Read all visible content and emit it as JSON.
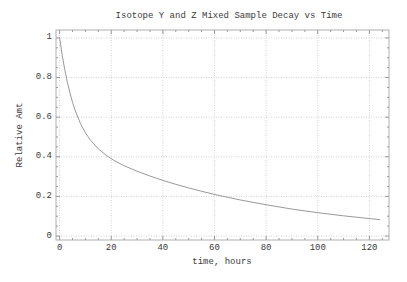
{
  "colors": {
    "background": "#ffffff",
    "curve": "#999999",
    "grid": "#d2d2d2",
    "frame": "#b0b0b0",
    "ticks": "#9a9a9a",
    "text": "#3b3b3b"
  },
  "chart_data": {
    "type": "line",
    "title": "Isotope Y and Z Mixed Sample Decay vs Time",
    "xlabel": "time, hours",
    "ylabel": "Relative Amt",
    "xlim": [
      -1.4,
      127.6
    ],
    "ylim": [
      -0.02,
      1.04
    ],
    "grid": true,
    "x_major_ticks": [
      0,
      20,
      40,
      60,
      80,
      100,
      120
    ],
    "x_tick_labels": [
      "0",
      "20",
      "40",
      "60",
      "80",
      "100",
      "120"
    ],
    "x_minor_step": 5,
    "y_major_ticks": [
      0,
      0.2,
      0.4,
      0.6,
      0.8,
      1
    ],
    "y_tick_labels": [
      "0",
      "0.2",
      "0.4",
      "0.6",
      "0.8",
      "1"
    ],
    "y_minor_step": 0.05,
    "series": [
      {
        "name": "Mixed sample relative amount",
        "color": "#999999",
        "points": [
          [
            0,
            1.0
          ],
          [
            1,
            0.913
          ],
          [
            2,
            0.84
          ],
          [
            3,
            0.776
          ],
          [
            4,
            0.722
          ],
          [
            5,
            0.675
          ],
          [
            6,
            0.635
          ],
          [
            8,
            0.57
          ],
          [
            10,
            0.521
          ],
          [
            12,
            0.483
          ],
          [
            15,
            0.44
          ],
          [
            18,
            0.408
          ],
          [
            21,
            0.382
          ],
          [
            25,
            0.355
          ],
          [
            30,
            0.327
          ],
          [
            35,
            0.303
          ],
          [
            40,
            0.281
          ],
          [
            45,
            0.261
          ],
          [
            50,
            0.243
          ],
          [
            55,
            0.226
          ],
          [
            60,
            0.21
          ],
          [
            70,
            0.182
          ],
          [
            80,
            0.158
          ],
          [
            90,
            0.136
          ],
          [
            100,
            0.118
          ],
          [
            110,
            0.102
          ],
          [
            120,
            0.088
          ],
          [
            124,
            0.083
          ]
        ]
      }
    ]
  }
}
